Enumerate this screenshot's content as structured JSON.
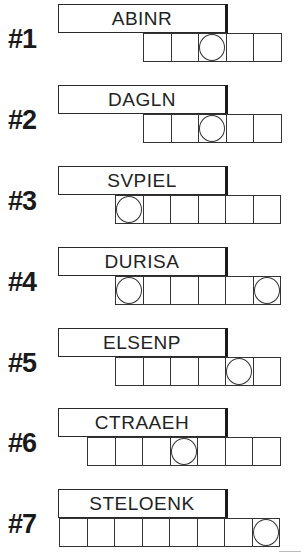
{
  "puzzles": [
    {
      "label": "#1",
      "letters": "ABINR",
      "cells": 5,
      "circled": [
        2
      ],
      "top": 4,
      "grid_left": 143
    },
    {
      "label": "#2",
      "letters": "DAGLN",
      "cells": 5,
      "circled": [
        2
      ],
      "top": 85,
      "grid_left": 143
    },
    {
      "label": "#3",
      "letters": "SVPIEL",
      "cells": 6,
      "circled": [
        0
      ],
      "top": 166,
      "grid_left": 115
    },
    {
      "label": "#4",
      "letters": "DURISA",
      "cells": 6,
      "circled": [
        0,
        5
      ],
      "top": 247,
      "grid_left": 115
    },
    {
      "label": "#5",
      "letters": "ELSENP",
      "cells": 6,
      "circled": [
        4
      ],
      "top": 328,
      "grid_left": 115
    },
    {
      "label": "#6",
      "letters": "CTRAAEH",
      "cells": 7,
      "circled": [
        3
      ],
      "top": 408,
      "grid_left": 87
    },
    {
      "label": "#7",
      "letters": "STELOENK",
      "cells": 8,
      "circled": [
        7
      ],
      "top": 489,
      "grid_left": 59
    }
  ],
  "colors": {
    "ink": "#1a1a1a",
    "background": "#ffffff"
  }
}
